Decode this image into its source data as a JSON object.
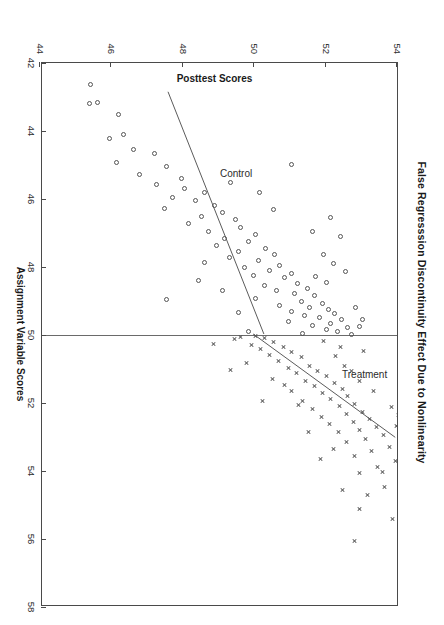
{
  "figure": {
    "title": "False Regresssion Discontinuity Effect Due to Nonlinearity",
    "rotation_note": "90",
    "background_color": "#ffffff",
    "frame_color": "#4a4a4a",
    "marker_color": "#545454",
    "fit_line_color": "#5a5a5a",
    "cutoff_line_color": "#6a6a6a"
  },
  "annotations": {
    "treatment_label": "Treatment",
    "control_label": "Control"
  },
  "chart_data": {
    "type": "scatter",
    "title": "False Regresssion Discontinuity Effect Due to Nonlinearity",
    "xlabel": "Assignment Variable Scores",
    "ylabel": "Posttest Scores",
    "xlim": [
      42,
      58
    ],
    "ylim": [
      44,
      54
    ],
    "xticks": [
      42,
      44,
      46,
      48,
      50,
      52,
      54,
      56,
      58
    ],
    "yticks": [
      44,
      46,
      48,
      50,
      52,
      54
    ],
    "xtick_labels": [
      "42",
      "44",
      "46",
      "48",
      "50",
      "52",
      "54",
      "56",
      "58"
    ],
    "ytick_labels": [
      "44",
      "46",
      "48",
      "50",
      "52",
      "54"
    ],
    "grid": false,
    "legend": null,
    "cutoff": 50,
    "annotations": [
      {
        "text": "Control",
        "x": 45.1,
        "y": 49.05
      },
      {
        "text": "Treatment",
        "x": 51.0,
        "y": 52.45
      }
    ],
    "fit_lines": [
      {
        "name": "Control fit",
        "group": "control",
        "x": [
          42.85,
          50.0
        ],
        "y": [
          47.55,
          50.25
        ]
      },
      {
        "name": "Treatment fit",
        "group": "treatment",
        "x": [
          50.0,
          53.05
        ],
        "y": [
          49.95,
          53.95
        ]
      }
    ],
    "series": [
      {
        "name": "Control",
        "group": "control",
        "marker": "circle-open",
        "points": [
          [
            42.62,
            45.42
          ],
          [
            43.16,
            45.62
          ],
          [
            43.18,
            45.38
          ],
          [
            43.5,
            46.2
          ],
          [
            44.1,
            46.35
          ],
          [
            44.22,
            45.95
          ],
          [
            44.55,
            46.62
          ],
          [
            44.66,
            47.2
          ],
          [
            44.92,
            46.15
          ],
          [
            45.05,
            47.55
          ],
          [
            45.28,
            46.8
          ],
          [
            45.4,
            47.95
          ],
          [
            45.58,
            47.25
          ],
          [
            45.7,
            48.05
          ],
          [
            45.82,
            48.62
          ],
          [
            45.95,
            47.7
          ],
          [
            46.05,
            48.35
          ],
          [
            46.18,
            48.88
          ],
          [
            46.28,
            47.48
          ],
          [
            46.4,
            49.1
          ],
          [
            46.52,
            48.52
          ],
          [
            46.6,
            49.48
          ],
          [
            46.72,
            48.15
          ],
          [
            46.84,
            49.62
          ],
          [
            46.95,
            48.72
          ],
          [
            47.05,
            50.05
          ],
          [
            47.15,
            49.18
          ],
          [
            47.25,
            49.85
          ],
          [
            47.36,
            48.95
          ],
          [
            47.46,
            50.32
          ],
          [
            47.55,
            49.55
          ],
          [
            47.64,
            50.58
          ],
          [
            47.72,
            49.32
          ],
          [
            47.8,
            50.12
          ],
          [
            47.88,
            48.62
          ],
          [
            47.95,
            50.72
          ],
          [
            48.02,
            49.72
          ],
          [
            48.1,
            50.42
          ],
          [
            48.18,
            51.05
          ],
          [
            48.25,
            49.98
          ],
          [
            48.32,
            50.85
          ],
          [
            48.4,
            48.45
          ],
          [
            48.48,
            51.22
          ],
          [
            48.55,
            50.28
          ],
          [
            48.62,
            51.48
          ],
          [
            48.7,
            50.62
          ],
          [
            48.78,
            51.12
          ],
          [
            48.85,
            51.68
          ],
          [
            48.92,
            50.05
          ],
          [
            49.0,
            51.32
          ],
          [
            49.06,
            51.92
          ],
          [
            49.12,
            50.72
          ],
          [
            49.18,
            51.55
          ],
          [
            49.24,
            52.08
          ],
          [
            49.3,
            51.05
          ],
          [
            49.36,
            52.25
          ],
          [
            49.42,
            51.42
          ],
          [
            49.48,
            51.82
          ],
          [
            49.54,
            52.45
          ],
          [
            49.6,
            50.95
          ],
          [
            49.66,
            52.15
          ],
          [
            49.72,
            51.62
          ],
          [
            49.78,
            52.62
          ],
          [
            49.84,
            52.02
          ],
          [
            49.9,
            52.32
          ],
          [
            49.95,
            51.35
          ],
          [
            49.98,
            52.72
          ],
          [
            44.98,
            51.05
          ],
          [
            45.8,
            50.15
          ],
          [
            46.55,
            52.15
          ],
          [
            47.1,
            52.42
          ],
          [
            48.12,
            52.55
          ],
          [
            49.2,
            52.85
          ],
          [
            48.95,
            47.55
          ],
          [
            46.95,
            51.62
          ],
          [
            47.62,
            51.95
          ],
          [
            48.45,
            52.02
          ],
          [
            49.55,
            53.02
          ],
          [
            49.9,
            49.85
          ],
          [
            49.35,
            49.55
          ],
          [
            48.68,
            49.12
          ],
          [
            47.9,
            52.22
          ],
          [
            46.3,
            50.55
          ],
          [
            45.52,
            49.35
          ],
          [
            49.75,
            52.95
          ],
          [
            48.28,
            51.72
          ]
        ]
      },
      {
        "name": "Treatment",
        "group": "treatment",
        "marker": "x",
        "points": [
          [
            50.02,
            50.05
          ],
          [
            50.05,
            49.62
          ],
          [
            50.08,
            50.28
          ],
          [
            50.12,
            49.45
          ],
          [
            50.2,
            50.55
          ],
          [
            50.28,
            49.92
          ],
          [
            50.35,
            50.82
          ],
          [
            50.42,
            50.18
          ],
          [
            50.5,
            51.05
          ],
          [
            50.58,
            50.42
          ],
          [
            50.66,
            51.32
          ],
          [
            50.75,
            50.68
          ],
          [
            50.82,
            49.78
          ],
          [
            50.9,
            51.55
          ],
          [
            50.98,
            50.95
          ],
          [
            51.05,
            51.78
          ],
          [
            51.12,
            51.18
          ],
          [
            51.2,
            52.02
          ],
          [
            51.28,
            50.52
          ],
          [
            51.35,
            51.45
          ],
          [
            51.42,
            52.25
          ],
          [
            51.5,
            51.68
          ],
          [
            51.58,
            52.48
          ],
          [
            51.65,
            51.05
          ],
          [
            51.72,
            51.92
          ],
          [
            51.8,
            52.62
          ],
          [
            51.88,
            52.15
          ],
          [
            51.95,
            51.35
          ],
          [
            52.02,
            52.82
          ],
          [
            52.1,
            52.38
          ],
          [
            52.18,
            51.62
          ],
          [
            52.25,
            53.02
          ],
          [
            52.32,
            52.58
          ],
          [
            52.4,
            51.88
          ],
          [
            52.48,
            53.22
          ],
          [
            52.55,
            52.78
          ],
          [
            52.62,
            52.12
          ],
          [
            52.7,
            53.42
          ],
          [
            52.78,
            52.95
          ],
          [
            52.85,
            52.35
          ],
          [
            52.95,
            53.62
          ],
          [
            53.05,
            53.12
          ],
          [
            53.15,
            52.58
          ],
          [
            53.28,
            53.78
          ],
          [
            53.42,
            53.28
          ],
          [
            53.55,
            52.82
          ],
          [
            53.7,
            53.95
          ],
          [
            53.88,
            53.45
          ],
          [
            54.05,
            52.95
          ],
          [
            54.25,
            54.15
          ],
          [
            54.48,
            53.65
          ],
          [
            54.72,
            53.18
          ],
          [
            55.05,
            54.48
          ],
          [
            55.42,
            53.88
          ],
          [
            55.85,
            54.85
          ],
          [
            56.18,
            55.42
          ],
          [
            56.48,
            55.28
          ],
          [
            56.82,
            56.15
          ],
          [
            57.15,
            55.72
          ],
          [
            57.55,
            56.42
          ],
          [
            50.18,
            51.95
          ],
          [
            50.35,
            52.42
          ],
          [
            51.05,
            52.72
          ],
          [
            51.65,
            53.35
          ],
          [
            52.12,
            53.85
          ],
          [
            52.58,
            54.25
          ],
          [
            53.02,
            54.62
          ],
          [
            53.48,
            54.95
          ],
          [
            50.62,
            52.28
          ],
          [
            51.35,
            52.95
          ],
          [
            52.05,
            51.25
          ],
          [
            51.48,
            50.85
          ],
          [
            50.92,
            52.52
          ],
          [
            52.68,
            53.98
          ],
          [
            53.35,
            52.22
          ],
          [
            54.02,
            53.58
          ],
          [
            55.12,
            52.95
          ],
          [
            54.55,
            52.48
          ],
          [
            56.05,
            52.82
          ],
          [
            50.25,
            48.85
          ],
          [
            51.02,
            49.35
          ],
          [
            51.95,
            50.22
          ],
          [
            52.85,
            51.52
          ],
          [
            53.65,
            51.85
          ],
          [
            54.85,
            55.18
          ],
          [
            55.65,
            55.95
          ],
          [
            50.48,
            53.05
          ],
          [
            52.35,
            54.05
          ]
        ]
      }
    ]
  }
}
